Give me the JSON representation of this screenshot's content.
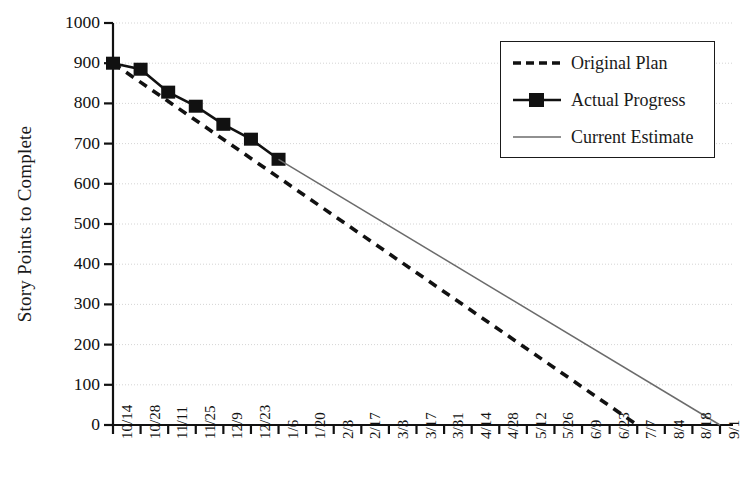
{
  "chart_data": {
    "type": "line",
    "title": "",
    "xlabel": "",
    "ylabel": "Story Points to Complete",
    "ylim": [
      0,
      1000
    ],
    "ytick_step": 100,
    "grid": true,
    "legend_position": "top-right",
    "categories": [
      "10/14",
      "10/28",
      "11/11",
      "11/25",
      "12/9",
      "12/23",
      "1/6",
      "1/20",
      "2/3",
      "2/17",
      "3/3",
      "3/17",
      "3/31",
      "4/14",
      "4/28",
      "5/12",
      "5/26",
      "6/9",
      "6/23",
      "7/7",
      "8/4",
      "8/18",
      "9/1"
    ],
    "ytick_labels": [
      "0",
      "100",
      "200",
      "300",
      "400",
      "500",
      "600",
      "700",
      "800",
      "900",
      "1000"
    ],
    "series": [
      {
        "name": "Original Plan",
        "style": "dashed",
        "color": "#111111",
        "marker": "none",
        "x": [
          "10/14",
          "7/7"
        ],
        "values": [
          900,
          0
        ]
      },
      {
        "name": "Actual Progress",
        "style": "solid",
        "color": "#111111",
        "marker": "square",
        "x": [
          "10/14",
          "10/28",
          "11/11",
          "11/25",
          "12/9",
          "12/23",
          "1/6"
        ],
        "values": [
          900,
          885,
          828,
          793,
          748,
          711,
          661
        ]
      },
      {
        "name": "Current Estimate",
        "style": "thin-solid",
        "color": "#6b6b6b",
        "marker": "none",
        "x": [
          "1/6",
          "9/1"
        ],
        "values": [
          661,
          0
        ]
      }
    ]
  },
  "legend": {
    "items": [
      {
        "label": "Original Plan",
        "sample": "dashed-line-sample"
      },
      {
        "label": "Actual Progress",
        "sample": "solid-line-square-marker-sample"
      },
      {
        "label": "Current Estimate",
        "sample": "thin-line-sample"
      }
    ]
  }
}
